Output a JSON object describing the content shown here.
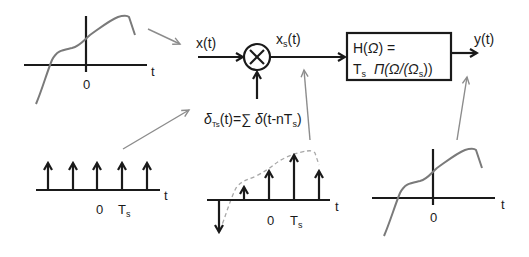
{
  "diagram": {
    "colors": {
      "signal_line": "#1a1a1a",
      "curve": "#7a7a7a",
      "pointer": "#8c8c8c",
      "dashed_envelope": "#a8a8a8",
      "background": "#ffffff"
    },
    "input": {
      "label": "x(t)"
    },
    "multiplier": {
      "symbol": "×",
      "type": "multiplier-node"
    },
    "sampled": {
      "label_main": "x",
      "label_sub": "s",
      "label_tail": "(t)"
    },
    "impulse_train": {
      "label_delta": "δ",
      "label_sub": "Ts",
      "label_rest": "(t)=∑ ",
      "label_delta2": "δ",
      "label_arg": "(t-nT",
      "label_arg_sub": "s",
      "label_close": ")"
    },
    "filter": {
      "line1": "H(Ω) =",
      "line1_H": "H(",
      "line1_omega": "Ω",
      "line1_end": ") =",
      "line2_T": "T",
      "line2_T_sub": "s",
      "line2_pi": "Π(Ω/(Ω",
      "line2_sub": "s",
      "line2_end": "))"
    },
    "output": {
      "label": "y(t)"
    },
    "plots": {
      "input_signal": {
        "axis_label": "t",
        "origin_label": "0"
      },
      "impulse_plot": {
        "axis_label": "t",
        "origin_label": "0",
        "period_label": "T",
        "period_sub": "s",
        "impulse_count": 5
      },
      "sampled_plot": {
        "axis_label": "t",
        "origin_label": "0",
        "period_label": "T",
        "period_sub": "s",
        "sample_count": 5
      },
      "output_signal": {
        "axis_label": "t",
        "origin_label": "0"
      }
    }
  }
}
